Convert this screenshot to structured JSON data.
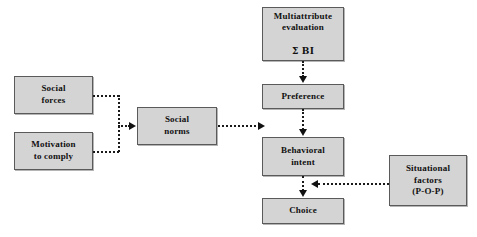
{
  "diagram": {
    "box_fill_color": "#d4d4d4",
    "box_border_color": "#5a5a5a",
    "connector_color": "#1a1a1a",
    "background_color": "#ffffff",
    "nodes": [
      {
        "id": "multiattribute",
        "label": "Multiattribute\nevaluation",
        "label_line3": "Σ BI",
        "x": 262,
        "y": 7,
        "w": 82,
        "h": 54
      },
      {
        "id": "social-forces",
        "label": "Social\nforces",
        "x": 14,
        "y": 76,
        "w": 79,
        "h": 38
      },
      {
        "id": "preference",
        "label": "Preference",
        "x": 262,
        "y": 84,
        "w": 82,
        "h": 25
      },
      {
        "id": "social-norms",
        "label": "Social\nnorms",
        "x": 137,
        "y": 107,
        "w": 80,
        "h": 38
      },
      {
        "id": "motivation-to-comply",
        "label": "Motivation\nto comply",
        "x": 14,
        "y": 132,
        "w": 79,
        "h": 38
      },
      {
        "id": "behavioral-intent",
        "label": "Behavioral\nintent",
        "x": 262,
        "y": 137,
        "w": 82,
        "h": 39
      },
      {
        "id": "situational-factors",
        "label": "Situational\nfactors\n(P-O-P)",
        "x": 389,
        "y": 155,
        "w": 78,
        "h": 51
      },
      {
        "id": "choice",
        "label": "Choice",
        "x": 262,
        "y": 198,
        "w": 82,
        "h": 26
      }
    ],
    "connectors": [
      {
        "id": "social-forces-to-bracket",
        "from": "social-forces",
        "to": "bracket",
        "style": "dotted"
      },
      {
        "id": "motivation-to-bracket",
        "from": "motivation-to-comply",
        "to": "bracket",
        "style": "dotted"
      },
      {
        "id": "bracket-to-social-norms",
        "from": "bracket",
        "to": "social-norms",
        "style": "dotted",
        "arrow": "right"
      },
      {
        "id": "social-norms-to-behavioral-intent",
        "from": "social-norms",
        "to": "behavioral-intent",
        "style": "dotted",
        "arrow": "right"
      },
      {
        "id": "multiattribute-to-preference",
        "from": "multiattribute",
        "to": "preference",
        "style": "dotted",
        "arrow": "down"
      },
      {
        "id": "preference-to-behavioral-intent",
        "from": "preference",
        "to": "behavioral-intent",
        "style": "dotted",
        "arrow": "down"
      },
      {
        "id": "behavioral-intent-to-choice",
        "from": "behavioral-intent",
        "to": "choice",
        "style": "dotted",
        "arrow": "down"
      },
      {
        "id": "situational-factors-to-behavioral-intent",
        "from": "situational-factors",
        "to": "behavioral-intent",
        "style": "dotted",
        "arrow": "left"
      }
    ]
  }
}
